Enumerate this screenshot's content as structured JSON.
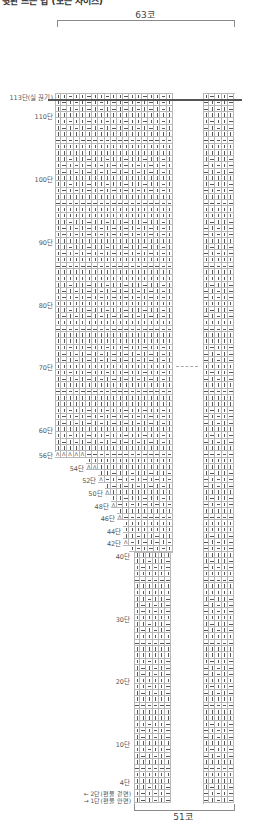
{
  "heading": "뒷판 뜨는 법 (모든 사이즈)",
  "top_bracket": {
    "label": "63코"
  },
  "bottom_bracket": {
    "label": "51코"
  },
  "row_labels": [
    {
      "text": "113단(실 끊기)",
      "row": 113
    },
    {
      "text": "110단",
      "row": 110
    },
    {
      "text": "100단",
      "row": 100
    },
    {
      "text": "90단",
      "row": 90
    },
    {
      "text": "80단",
      "row": 80
    },
    {
      "text": "70단",
      "row": 70
    },
    {
      "text": "60단",
      "row": 60
    },
    {
      "text": "56단",
      "row": 56
    },
    {
      "text": "54단",
      "row": 54
    },
    {
      "text": "52단",
      "row": 52
    },
    {
      "text": "50단",
      "row": 50
    },
    {
      "text": "48단",
      "row": 48
    },
    {
      "text": "46단",
      "row": 46
    },
    {
      "text": "44단",
      "row": 44
    },
    {
      "text": "42단",
      "row": 42
    },
    {
      "text": "40단",
      "row": 40
    },
    {
      "text": "30단",
      "row": 30
    },
    {
      "text": "20단",
      "row": 20
    },
    {
      "text": "10단",
      "row": 10
    },
    {
      "text": "4단",
      "row": 4
    }
  ],
  "legend": [
    {
      "text": "← 2단(편물 겉면)",
      "row": 2
    },
    {
      "text": "→ 1단(편물 안면)",
      "row": 1
    }
  ],
  "symbols": {
    "k": "knit (|)",
    "p": "purl (—)",
    "d": "decrease (Λ)"
  },
  "geometry": {
    "row_height": 6.28,
    "col_width": 6.2,
    "row1_bottom_y": 803,
    "upper_left_x": 55,
    "lower_left_x": 134,
    "left_block_right_x": 172,
    "right_block_x": 203,
    "right_cols": 5
  },
  "staircase": [
    {
      "row": 56,
      "decreases": 5,
      "start_col": 0
    },
    {
      "row": 54,
      "decreases": 2,
      "start_col": 5
    },
    {
      "row": 52,
      "decreases": 1,
      "start_col": 7
    },
    {
      "row": 50,
      "decreases": 1,
      "start_col": 8
    },
    {
      "row": 48,
      "decreases": 1,
      "start_col": 9
    },
    {
      "row": 46,
      "decreases": 1,
      "start_col": 10
    },
    {
      "row": 42,
      "decreases": 1,
      "start_col": 11
    }
  ],
  "row_patterns": {
    "k": "all knit",
    "p": "all purl",
    "r": "rib 1x1 (k, p alternating)",
    "s": "k2, p1 seed"
  },
  "pattern_cycle": [
    "k",
    "r",
    "r",
    "s",
    "k",
    "k",
    "p",
    "k",
    "r",
    "s"
  ],
  "cut_row": 113,
  "dashed_row": 70
}
